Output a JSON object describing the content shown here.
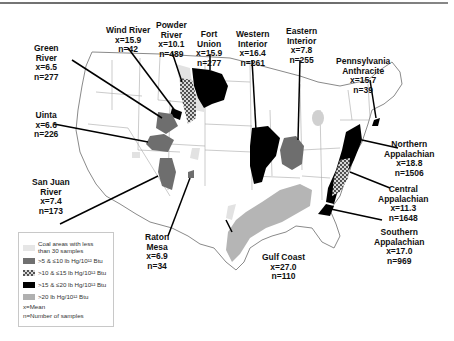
{
  "figure": {
    "units_note": "lb Hg/10^12 Btu",
    "colors": {
      "lt30": "#e6e6e6",
      "c5_10": "#707070",
      "c10_15": "#cfcfcf",
      "c15_20": "#000000",
      "gt20": "#b0b0b0",
      "state_lines": "#9a9a9a"
    }
  },
  "basins": [
    {
      "name_l1": "Green",
      "name_l2": "River",
      "mean": "x=6.5",
      "n": "n=277"
    },
    {
      "name_l1": "Wind River",
      "name_l2": "",
      "mean": "x=15.9",
      "n": "n=42"
    },
    {
      "name_l1": "Powder",
      "name_l2": "River",
      "mean": "x=10.1",
      "n": "n=489"
    },
    {
      "name_l1": "Fort",
      "name_l2": "Union",
      "mean": "x=15.9",
      "n": "n=277"
    },
    {
      "name_l1": "Western",
      "name_l2": "Interior",
      "mean": "x=16.4",
      "n": "n=261"
    },
    {
      "name_l1": "Eastern",
      "name_l2": "Interior",
      "mean": "x=7.8",
      "n": "n=255"
    },
    {
      "name_l1": "Pennsylvania",
      "name_l2": "Anthracite",
      "mean": "x=15.7",
      "n": "n=39"
    },
    {
      "name_l1": "Uinta",
      "name_l2": "",
      "mean": "x=6.6",
      "n": "n=226"
    },
    {
      "name_l1": "Northern",
      "name_l2": "Appalachian",
      "mean": "x=18.8",
      "n": "n=1506"
    },
    {
      "name_l1": "Central",
      "name_l2": "Appalachian",
      "mean": "x=11.3",
      "n": "n=1648"
    },
    {
      "name_l1": "San Juan",
      "name_l2": "River",
      "mean": "x=7.4",
      "n": "n=173"
    },
    {
      "name_l1": "Southern",
      "name_l2": "Appalachian",
      "mean": "x=17.0",
      "n": "n=969"
    },
    {
      "name_l1": "Raton",
      "name_l2": "Mesa",
      "mean": "x=6.9",
      "n": "n=34"
    },
    {
      "name_l1": "Gulf Coast",
      "name_l2": "",
      "mean": "x=27.0",
      "n": "n=110"
    }
  ],
  "legend": {
    "items": [
      {
        "label_l1": "Coal areas with less",
        "label_l2": "than 30 samples"
      },
      {
        "label_l1": ">5 & ≤10 lb Hg/10¹² Btu",
        "label_l2": ""
      },
      {
        "label_l1": ">10 & ≤15 lb Hg/10¹² Btu",
        "label_l2": ""
      },
      {
        "label_l1": ">15 & ≤20 lb Hg/10¹² Btu",
        "label_l2": ""
      },
      {
        "label_l1": ">20 lb Hg/10¹² Btu",
        "label_l2": ""
      }
    ],
    "mean_note": "x=Mean",
    "n_note": "n=Number of samples"
  }
}
